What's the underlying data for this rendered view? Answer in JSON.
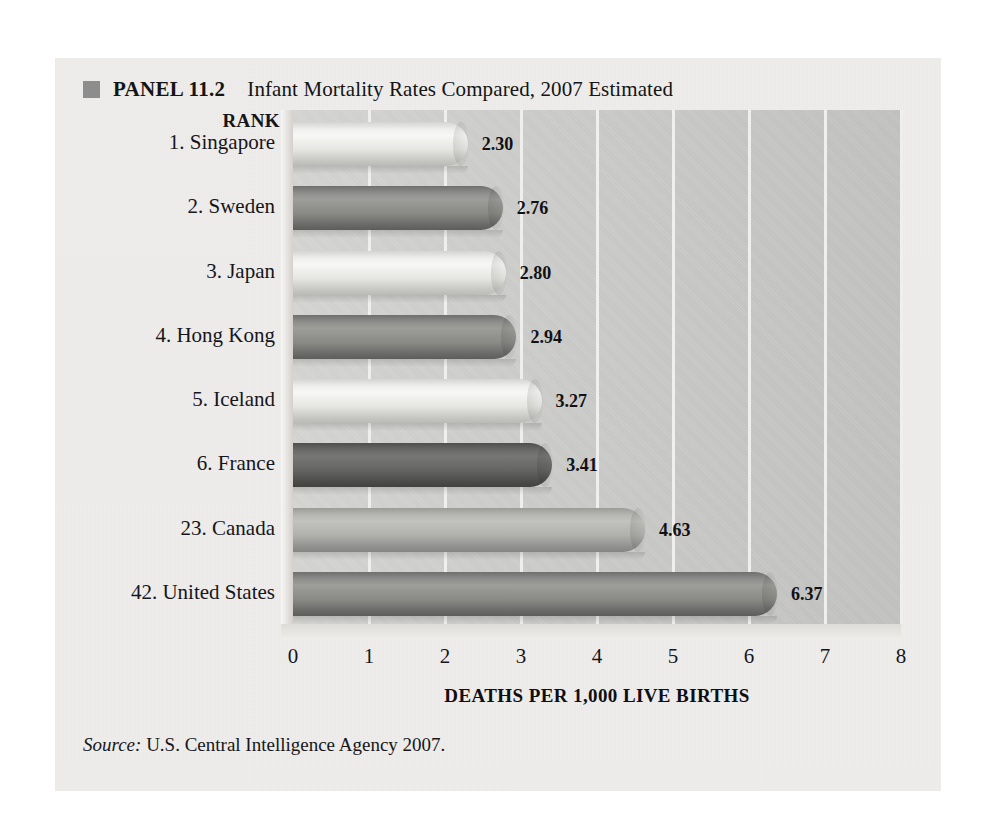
{
  "panel": {
    "marker_icon": "filled-square-icon",
    "label": "PANEL 11.2",
    "title": "Infant Mortality Rates Compared, 2007 Estimated"
  },
  "rank_header": "RANK",
  "source": {
    "prefix": "Source:",
    "text": "U.S. Central Intelligence Agency 2007."
  },
  "colors": {
    "page_background": "#ffffff",
    "panel_background": "#efeeec",
    "plot_background": "#c9c9c7",
    "gridline": "#efefee",
    "marker": "#8d8d8d",
    "text": "#16161a",
    "bar_light": "#eeeeec",
    "bar_mid": "#b6b6b3",
    "bar_dark": "#8e8e8c",
    "bar_darkest": "#6a6a68"
  },
  "chart_data": {
    "type": "bar",
    "orientation": "horizontal",
    "title": "Infant Mortality Rates Compared, 2007 Estimated",
    "xlabel": "DEATHS PER 1,000 LIVE BIRTHS",
    "ylabel": "RANK",
    "xlim": [
      0,
      8
    ],
    "xticks": [
      "0",
      "1",
      "2",
      "3",
      "4",
      "5",
      "6",
      "7",
      "8"
    ],
    "grid": true,
    "legend": "none",
    "categories": [
      "1. Singapore",
      "2. Sweden",
      "3. Japan",
      "4. Hong Kong",
      "5. Iceland",
      "6. France",
      "23. Canada",
      "42. United States"
    ],
    "values": [
      2.3,
      2.76,
      2.8,
      2.94,
      3.27,
      3.41,
      4.63,
      6.37
    ],
    "value_labels": [
      "2.30",
      "2.76",
      "2.80",
      "2.94",
      "3.27",
      "3.41",
      "4.63",
      "6.37"
    ],
    "bar_shades": [
      "light",
      "dark",
      "light",
      "dark",
      "light",
      "darkest",
      "mid",
      "dark"
    ]
  }
}
